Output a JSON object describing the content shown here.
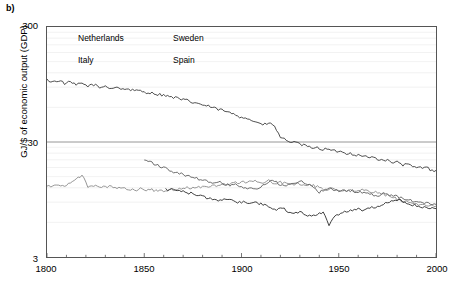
{
  "panel": {
    "label": "b)"
  },
  "axes": {
    "ylabel": "GJ/$ of economic output (GDP)",
    "xlabel": "",
    "yticks": [
      "300",
      "30",
      "3"
    ],
    "xticks": [
      "1800",
      "1850",
      "1900",
      "1950",
      "2000"
    ]
  },
  "legend": {
    "items": [
      {
        "label": "Netherlands",
        "color": "#3a3a3a",
        "dash": "4,2"
      },
      {
        "label": "Sweden",
        "color": "#8a8a8a",
        "dash": "none"
      },
      {
        "label": "Italy",
        "color": "#2b2b2b",
        "dash": "none"
      },
      {
        "label": "Spain",
        "color": "#5e5e5e",
        "dash": "none"
      }
    ]
  },
  "colors": {
    "axis": "#555555",
    "gridline_major": "#8a8a8a",
    "gridline_minor": "#efefef",
    "background": "#ffffff"
  },
  "chart_data": {
    "type": "line",
    "title": "",
    "xlabel": "",
    "ylabel": "GJ/$ of economic output (GDP)",
    "yscale": "log",
    "ylim": [
      3,
      300
    ],
    "xlim": [
      1800,
      2000
    ],
    "grid": true,
    "legend_position": "top-left-inside",
    "ytick_values": [
      3,
      30,
      300
    ],
    "xtick_values": [
      1800,
      1850,
      1900,
      1950,
      2000
    ],
    "series": [
      {
        "name": "Netherlands",
        "color": "#3a3a3a",
        "x": [
          1800,
          1803,
          1806,
          1809,
          1812,
          1815,
          1818,
          1821,
          1824,
          1827,
          1830,
          1833,
          1836,
          1839,
          1842,
          1845,
          1848,
          1851,
          1854,
          1857,
          1860,
          1863,
          1866,
          1869,
          1872,
          1875,
          1878,
          1881,
          1884,
          1887,
          1890,
          1893,
          1896,
          1899,
          1902,
          1905,
          1908,
          1911,
          1914,
          1917,
          1920,
          1923,
          1926,
          1929,
          1932,
          1935,
          1938,
          1941,
          1944,
          1947,
          1950,
          1953,
          1956,
          1959,
          1962,
          1965,
          1968,
          1971,
          1974,
          1977,
          1980,
          1983,
          1986,
          1989,
          1992,
          1995,
          1998,
          2000
        ],
        "y": [
          104,
          100,
          103,
          97,
          99,
          94,
          97,
          92,
          95,
          89,
          92,
          88,
          90,
          86,
          87,
          83,
          84,
          81,
          80,
          78,
          77,
          74,
          73,
          70,
          69,
          66,
          65,
          62,
          61,
          58,
          57,
          54,
          53,
          50,
          49,
          46,
          45,
          42,
          44,
          41,
          33,
          31,
          30,
          29,
          28,
          27,
          27,
          26,
          26,
          25,
          25,
          24,
          24,
          23,
          23,
          22,
          22,
          21,
          21,
          20,
          20,
          19,
          19,
          18,
          18,
          18,
          17,
          17
        ]
      },
      {
        "name": "Sweden",
        "color": "#8a8a8a",
        "x": [
          1800,
          1803,
          1806,
          1809,
          1812,
          1815,
          1818,
          1821,
          1824,
          1827,
          1830,
          1833,
          1836,
          1839,
          1842,
          1845,
          1848,
          1851,
          1854,
          1857,
          1860,
          1863,
          1866,
          1869,
          1872,
          1875,
          1878,
          1881,
          1884,
          1887,
          1890,
          1893,
          1896,
          1899,
          1902,
          1905,
          1908,
          1911,
          1914,
          1917,
          1920,
          1923,
          1926,
          1929,
          1932,
          1935,
          1938,
          1941,
          1944,
          1947,
          1950,
          1953,
          1956,
          1959,
          1962,
          1965,
          1968,
          1971,
          1974,
          1977,
          1980,
          1983,
          1986,
          1989,
          1992,
          1995,
          1998,
          2000
        ],
        "y": [
          12.5,
          12.4,
          12.6,
          12.5,
          13.0,
          14.2,
          15.5,
          12.3,
          12.6,
          12.4,
          12.2,
          12.4,
          12.0,
          12.3,
          11.6,
          11.4,
          11.8,
          11.3,
          11.5,
          11.2,
          11.4,
          11.6,
          11.3,
          11.8,
          12.0,
          11.9,
          12.2,
          12.3,
          12.4,
          12.6,
          12.8,
          13.0,
          13.2,
          13.3,
          13.5,
          13.6,
          13.7,
          13.4,
          13.8,
          13.2,
          13.4,
          13.0,
          12.9,
          13.0,
          12.6,
          12.7,
          12.4,
          12.0,
          11.6,
          11.8,
          11.5,
          11.3,
          11.5,
          11.2,
          11.4,
          11.2,
          11.0,
          10.8,
          10.4,
          10.0,
          9.6,
          9.2,
          9.0,
          8.8,
          8.6,
          8.5,
          8.4,
          8.3
        ]
      },
      {
        "name": "Italy",
        "color": "#2b2b2b",
        "x": [
          1861,
          1864,
          1867,
          1870,
          1873,
          1876,
          1879,
          1882,
          1885,
          1888,
          1891,
          1894,
          1897,
          1900,
          1903,
          1906,
          1909,
          1912,
          1915,
          1918,
          1921,
          1924,
          1927,
          1930,
          1933,
          1936,
          1939,
          1942,
          1945,
          1948,
          1951,
          1954,
          1957,
          1960,
          1963,
          1966,
          1969,
          1972,
          1975,
          1978,
          1981,
          1984,
          1987,
          1990,
          1993,
          1996,
          1999,
          2000
        ],
        "y": [
          11.6,
          11.5,
          11.3,
          11.2,
          10.8,
          10.6,
          10.2,
          9.8,
          9.5,
          9.3,
          9.6,
          9.4,
          9.1,
          9.0,
          8.8,
          9.0,
          8.7,
          8.5,
          8.2,
          7.6,
          8.0,
          7.5,
          7.2,
          7.4,
          7.0,
          6.8,
          7.0,
          7.4,
          5.6,
          6.8,
          7.2,
          7.4,
          7.6,
          7.8,
          7.6,
          8.0,
          8.2,
          8.6,
          8.8,
          9.2,
          9.4,
          9.0,
          8.6,
          8.4,
          8.2,
          8.0,
          7.9,
          7.9
        ]
      },
      {
        "name": "Spain",
        "color": "#5e5e5e",
        "x": [
          1850,
          1853,
          1856,
          1859,
          1862,
          1865,
          1868,
          1871,
          1874,
          1877,
          1880,
          1883,
          1886,
          1889,
          1892,
          1895,
          1898,
          1901,
          1904,
          1907,
          1910,
          1913,
          1916,
          1919,
          1922,
          1925,
          1928,
          1931,
          1934,
          1937,
          1940,
          1943,
          1946,
          1949,
          1952,
          1955,
          1958,
          1961,
          1964,
          1967,
          1970,
          1973,
          1976,
          1979,
          1982,
          1985,
          1988,
          1991,
          1994,
          1997,
          2000
        ],
        "y": [
          21.0,
          20.0,
          19.2,
          18.0,
          17.4,
          16.6,
          16.0,
          15.4,
          14.8,
          14.4,
          14.0,
          13.6,
          13.2,
          13.4,
          12.8,
          12.6,
          12.8,
          12.2,
          12.0,
          11.8,
          12.4,
          13.0,
          14.0,
          13.0,
          12.4,
          12.6,
          13.2,
          13.6,
          13.0,
          12.0,
          11.0,
          11.4,
          11.8,
          11.4,
          11.2,
          11.4,
          11.2,
          11.0,
          10.8,
          10.4,
          10.2,
          10.6,
          10.4,
          10.2,
          9.8,
          9.4,
          9.2,
          9.0,
          8.8,
          8.7,
          8.6
        ]
      }
    ]
  }
}
